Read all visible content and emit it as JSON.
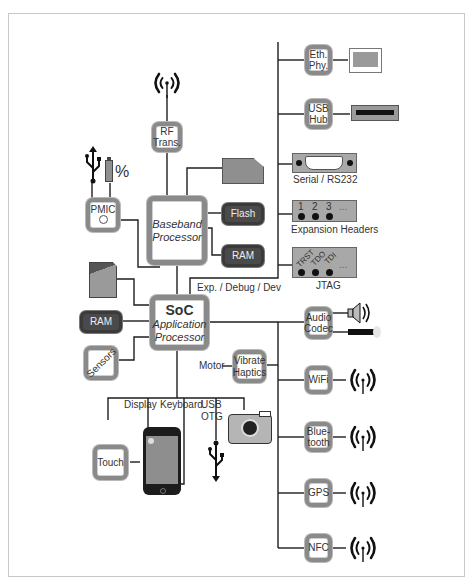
{
  "diagram": {
    "title": "",
    "central": {
      "soc": {
        "title": "SoC",
        "subtitle_line1": "Application",
        "subtitle_line2": "Processor"
      },
      "baseband": {
        "line1": "Baseband",
        "line2": "Processor"
      }
    },
    "chips": {
      "rf": {
        "line1": "RF",
        "line2": "Trans."
      },
      "pmic": {
        "line1": "PMIC",
        "icon": "power-icon"
      },
      "flash": {
        "line1": "Flash"
      },
      "bb_ram": {
        "line1": "RAM"
      },
      "soc_ram": {
        "line1": "RAM"
      },
      "sensors": {
        "line1": "Sensors"
      },
      "haptics": {
        "line1": "Vibrate",
        "line2": "Haptics"
      },
      "touch": {
        "line1": "Touch"
      },
      "eth": {
        "line1": "Eth.",
        "line2": "Phy."
      },
      "usbhub": {
        "line1": "USB",
        "line2": "Hub"
      },
      "audio": {
        "line1": "Audio",
        "line2": "Codec"
      },
      "wifi": {
        "line1": "WiFi"
      },
      "bt": {
        "line1": "Blue-",
        "line2": "tooth"
      },
      "gps": {
        "line1": "GPS"
      },
      "nfc": {
        "line1": "NFC"
      }
    },
    "labels": {
      "serial": "Serial / RS232",
      "expansion": "Expansion Headers",
      "jtag": "JTAG",
      "exp_bus": "Exp. / Debug / Dev",
      "motor": "Motor",
      "display": "Display",
      "keyboard": "Keyboard",
      "usb_otg_1": "USB",
      "usb_otg_2": "OTG",
      "battery_pct": "%",
      "header_pins": [
        "1",
        "2",
        "3",
        "..."
      ],
      "jtag_pins": [
        "TRST",
        "TDO",
        "TDI",
        "..."
      ]
    },
    "icons": [
      "antenna-icon",
      "usb-icon",
      "battery-icon",
      "sim-card-icon",
      "sd-card-icon",
      "ethernet-port-icon",
      "usb-port-icon",
      "db9-serial-icon",
      "speaker-icon",
      "microphone-icon",
      "camera-icon",
      "smartphone-icon"
    ],
    "colors": {
      "chip_border": "#8a8a8a",
      "dark_chip": "#4a4a4a",
      "line": "#222222",
      "connector": "#a8a8a8"
    }
  }
}
